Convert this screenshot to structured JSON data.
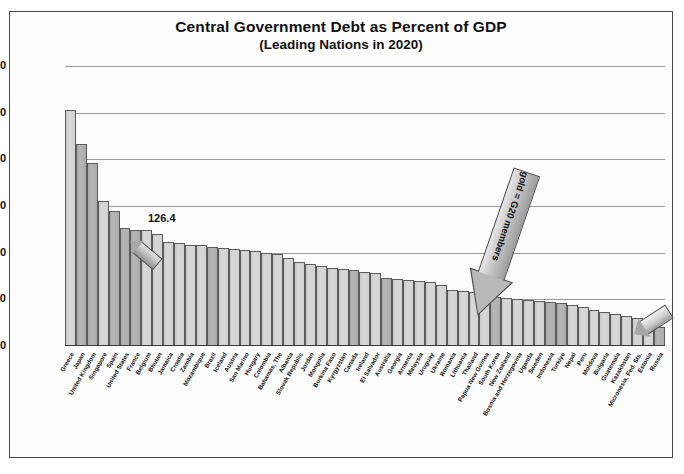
{
  "chart_data": {
    "type": "bar",
    "title": "Central Government Debt as Percent of GDP",
    "subtitle": "(Leading Nations in 2020)",
    "xlabel": "",
    "ylabel": "Percent of GDP",
    "ylim": [
      0,
      300
    ],
    "yticks": [
      300,
      250,
      200,
      150,
      100,
      50,
      0
    ],
    "grid": true,
    "legend_position": "none",
    "annotations": [
      {
        "name": "value-label",
        "text": "126.4",
        "points_to": "United States"
      },
      {
        "name": "g20-arrow-label",
        "text": "gold  =  G20 members"
      }
    ],
    "series_name": "Central government debt (% of GDP), 2020",
    "categories": [
      "Greece",
      "Japan",
      "United Kingdom",
      "Singapore",
      "Spain",
      "United States",
      "France",
      "Belgium",
      "Bhutan",
      "Jamaica",
      "Croatia",
      "Zambia",
      "Mozambique",
      "Brazil",
      "Iceland",
      "Austria",
      "San Marino",
      "Hungary",
      "Colombia",
      "Bahamas, The",
      "Albania",
      "Slovak Republic",
      "Jordan",
      "Mongolia",
      "Burkina Faso",
      "Kyrgyzstan",
      "Canada",
      "Ireland",
      "El Salvador",
      "Australia",
      "Georgia",
      "Armenia",
      "Malaysia",
      "Uruguay",
      "Ukraine",
      "Romania",
      "Lithuania",
      "Thailand",
      "Papua New Guinea",
      "South Korea",
      "New Zealand",
      "Bosnia and Herzegovina",
      "Uganda",
      "Sweden",
      "Indonesia",
      "Turkiye",
      "Nepal",
      "Peru",
      "Moldova",
      "Bulgaria",
      "Guatemala",
      "Kazakhstan",
      "Micronesia, Fed. Sts.",
      "Estonia",
      "Russia"
    ],
    "values": [
      253.0,
      216.0,
      196.0,
      155.0,
      145.0,
      126.4,
      124.0,
      124.0,
      120.0,
      111.0,
      110.0,
      108.0,
      108.0,
      106.0,
      105.0,
      104.0,
      103.0,
      102.0,
      100.0,
      99.0,
      94.0,
      90.0,
      88.0,
      86.0,
      84.0,
      83.0,
      81.0,
      79.0,
      78.0,
      73.0,
      72.0,
      71.0,
      70.0,
      69.0,
      65.0,
      60.0,
      59.0,
      58.0,
      54.0,
      52.0,
      51.0,
      50.0,
      49.0,
      48.0,
      47.0,
      46.0,
      44.0,
      42.0,
      39.0,
      36.0,
      34.0,
      32.0,
      30.0,
      27.0,
      20.0
    ],
    "g20_members": [
      "Japan",
      "United Kingdom",
      "Spain",
      "United States",
      "France",
      "Brazil",
      "Canada",
      "Australia",
      "South Korea",
      "Indonesia",
      "Turkiye",
      "Russia"
    ],
    "colors": {
      "bar": "#d2d2d2",
      "bar_g20": "#ababab",
      "grid": "#9a9a9a",
      "axis": "#3a3a3a",
      "text": "#111111"
    }
  },
  "source": {
    "text": ""
  }
}
